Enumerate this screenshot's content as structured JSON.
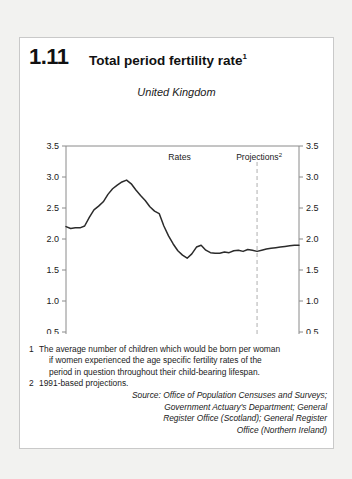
{
  "figure": {
    "number": "1.11",
    "title": "Total period fertility rate",
    "title_footnote": "1",
    "subtitle": "United Kingdom"
  },
  "annotations": {
    "rates_label": "Rates",
    "projections_label": "Projections",
    "projections_footnote": "2",
    "divider_year": 1992
  },
  "notes": [
    {
      "marker": "1",
      "lines": [
        "The average number of children which would be born per woman",
        "if women experienced the age specific fertility rates of the",
        "period in question throughout their child-bearing lifespan."
      ]
    },
    {
      "marker": "2",
      "lines": [
        "1991-based projections."
      ]
    }
  ],
  "source": [
    "Source: Office of Population Censuses and Surveys;",
    "Government Actuary's Department; General",
    "Register Office (Scotland); General Register",
    "Office (Northern Ireland)"
  ],
  "colors": {
    "line": "#2b2b2b",
    "frame": "#8a8a8a",
    "divider": "#b0b0b0",
    "card_bg": "#ffffff",
    "page_bg": "#f2f2f0",
    "text": "#1a1a1a"
  },
  "chart_data": {
    "type": "line",
    "title": "Total period fertility rate",
    "subtitle": "United Kingdom",
    "xlabel": "",
    "ylabel": "",
    "xlim": [
      1951,
      2001
    ],
    "ylim": [
      0,
      3.5
    ],
    "xticks": [
      1951,
      1961,
      1971,
      1981,
      1991,
      2001
    ],
    "yticks": [
      0,
      0.5,
      1.0,
      1.5,
      2.0,
      2.5,
      3.0,
      3.5
    ],
    "ytick_labels": [
      "0",
      "0.5",
      "1.0",
      "1.5",
      "2.0",
      "2.5",
      "3.0",
      "3.5"
    ],
    "xtick_labels": [
      "1951",
      "1961",
      "1971",
      "1981",
      "1991",
      "2001"
    ],
    "grid": false,
    "legend": false,
    "dual_y_axis": true,
    "series": [
      {
        "name": "Total period fertility rate",
        "x": [
          1951,
          1952,
          1953,
          1954,
          1955,
          1956,
          1957,
          1958,
          1959,
          1960,
          1961,
          1962,
          1963,
          1964,
          1965,
          1966,
          1967,
          1968,
          1969,
          1970,
          1971,
          1972,
          1973,
          1974,
          1975,
          1976,
          1977,
          1978,
          1979,
          1980,
          1981,
          1982,
          1983,
          1984,
          1985,
          1986,
          1987,
          1988,
          1989,
          1990,
          1991,
          1992,
          1993,
          1994,
          1995,
          1996,
          1997,
          1998,
          1999,
          2000,
          2001
        ],
        "values": [
          2.2,
          2.17,
          2.18,
          2.18,
          2.21,
          2.35,
          2.47,
          2.53,
          2.6,
          2.72,
          2.81,
          2.87,
          2.92,
          2.95,
          2.89,
          2.79,
          2.7,
          2.62,
          2.52,
          2.45,
          2.41,
          2.21,
          2.05,
          1.92,
          1.81,
          1.74,
          1.69,
          1.76,
          1.87,
          1.9,
          1.82,
          1.78,
          1.77,
          1.77,
          1.79,
          1.78,
          1.81,
          1.82,
          1.8,
          1.83,
          1.82,
          1.8,
          1.82,
          1.84,
          1.85,
          1.86,
          1.87,
          1.88,
          1.89,
          1.9,
          1.9
        ]
      }
    ]
  }
}
